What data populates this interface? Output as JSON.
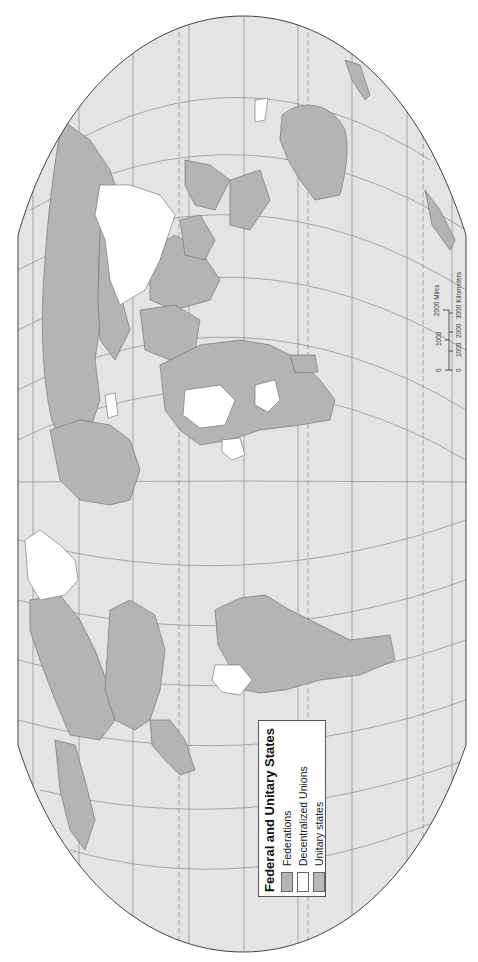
{
  "map": {
    "title": "Federal and Unitary States",
    "orientation": "rotated 90° clockwise (north at left)",
    "colors": {
      "ocean": "#e4e4e4",
      "land_federation": "#b4b4b4",
      "land_unitary": "#b4b4b4",
      "decentralized_union": "#ffffff",
      "outline": "#555555",
      "graticule": "#8a8a8a"
    }
  },
  "legend": {
    "title": "Federal and Unitary States",
    "items": [
      {
        "label": "Federations",
        "color": "#b4b4b4"
      },
      {
        "label": "Decentralized Unions",
        "color": "#ffffff"
      },
      {
        "label": "Unitary states",
        "color": "#b8b8b8"
      }
    ]
  },
  "scale": {
    "miles_ticks": [
      "0",
      "1000",
      "2000 Miles"
    ],
    "km_ticks": [
      "0",
      "1000",
      "2000",
      "3000 Kilometers"
    ]
  }
}
